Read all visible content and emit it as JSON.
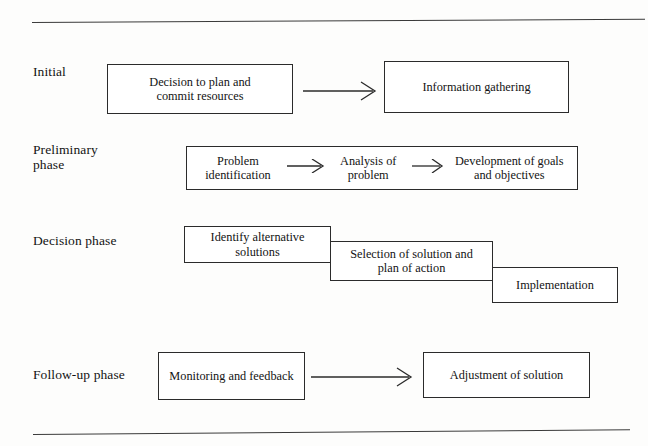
{
  "figure": {
    "type": "flow-diagram",
    "stroke_color": "#2b2b2b",
    "background_color": "#ffffff",
    "rules": {
      "top": "horizontal-rule",
      "bottom": "horizontal-rule"
    }
  },
  "rows": [
    {
      "id": "initial",
      "label": "Initial",
      "boxes": [
        {
          "id": "decision-to-plan",
          "text": "Decision to plan and\ncommit resources"
        },
        {
          "id": "information-gathering",
          "text": "Information gathering"
        }
      ],
      "arrows": [
        {
          "id": "arrow-initial",
          "from": "decision-to-plan",
          "to": "information-gathering",
          "direction": "right"
        }
      ]
    },
    {
      "id": "preliminary",
      "label": "Preliminary\nphase",
      "boxes": [
        {
          "id": "preliminary-compound",
          "cells": [
            {
              "id": "problem-identification",
              "text": "Problem\nidentification"
            },
            {
              "id": "analysis-of-problem",
              "text": "Analysis of\nproblem"
            },
            {
              "id": "development-of-goals",
              "text": "Development of goals\nand objectives"
            }
          ],
          "arrows": [
            {
              "id": "arrow-prelim-1",
              "from": "problem-identification",
              "to": "analysis-of-problem",
              "direction": "right"
            },
            {
              "id": "arrow-prelim-2",
              "from": "analysis-of-problem",
              "to": "development-of-goals",
              "direction": "right"
            }
          ]
        }
      ]
    },
    {
      "id": "decision",
      "label": "Decision phase",
      "boxes": [
        {
          "id": "identify-alternative-solutions",
          "text": "Identify alternative\nsolutions"
        },
        {
          "id": "selection-of-solution",
          "text": "Selection of  solution and\nplan of action"
        },
        {
          "id": "implementation",
          "text": "Implementation"
        }
      ],
      "arrows": []
    },
    {
      "id": "follow-up",
      "label": "Follow-up phase",
      "boxes": [
        {
          "id": "monitoring-and-feedback",
          "text": "Monitoring and feedback"
        },
        {
          "id": "adjustment-of-solution",
          "text": "Adjustment of solution"
        }
      ],
      "arrows": [
        {
          "id": "arrow-followup",
          "from": "monitoring-and-feedback",
          "to": "adjustment-of-solution",
          "direction": "right"
        }
      ]
    }
  ]
}
